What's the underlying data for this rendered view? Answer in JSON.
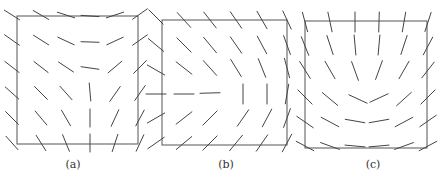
{
  "figure": {
    "panels": [
      {
        "id": "a",
        "caption": "(a)",
        "caption_x": 73,
        "box": {
          "x": 17,
          "y": 16,
          "w": 121,
          "h": 128
        },
        "seg_len": 18,
        "segments": [
          [
            12,
            15,
            32
          ],
          [
            41,
            15,
            30
          ],
          [
            66,
            15,
            18
          ],
          [
            90,
            16,
            4
          ],
          [
            115,
            15,
            -18
          ],
          [
            140,
            14,
            -35
          ],
          [
            12,
            40,
            35
          ],
          [
            41,
            40,
            32
          ],
          [
            66,
            41,
            25
          ],
          [
            90,
            42,
            2
          ],
          [
            115,
            41,
            -25
          ],
          [
            140,
            40,
            -35
          ],
          [
            12,
            67,
            38
          ],
          [
            41,
            67,
            38
          ],
          [
            66,
            67,
            34
          ],
          [
            90,
            68,
            8
          ],
          [
            115,
            67,
            -40
          ],
          [
            140,
            67,
            -45
          ],
          [
            12,
            93,
            42
          ],
          [
            41,
            93,
            45
          ],
          [
            66,
            93,
            48
          ],
          [
            90,
            92,
            85
          ],
          [
            115,
            94,
            -55
          ],
          [
            140,
            93,
            -55
          ],
          [
            12,
            118,
            45
          ],
          [
            41,
            118,
            50
          ],
          [
            66,
            118,
            60
          ],
          [
            90,
            118,
            90
          ],
          [
            115,
            118,
            -65
          ],
          [
            140,
            118,
            -62
          ],
          [
            12,
            143,
            48
          ],
          [
            41,
            143,
            58
          ],
          [
            66,
            143,
            68
          ],
          [
            90,
            143,
            90
          ],
          [
            115,
            143,
            -72
          ],
          [
            140,
            143,
            -65
          ]
        ]
      },
      {
        "id": "b",
        "caption": "(b)",
        "caption_x": 226,
        "box": {
          "x": 162,
          "y": 20,
          "w": 125,
          "h": 125
        },
        "seg_len": 20,
        "segments": [
          [
            156,
            17,
            45
          ],
          [
            184,
            20,
            48
          ],
          [
            210,
            20,
            52
          ],
          [
            236,
            20,
            55
          ],
          [
            262,
            20,
            60
          ],
          [
            287,
            20,
            65
          ],
          [
            156,
            45,
            40
          ],
          [
            184,
            45,
            45
          ],
          [
            210,
            45,
            50
          ],
          [
            236,
            45,
            55
          ],
          [
            262,
            45,
            62
          ],
          [
            287,
            45,
            70
          ],
          [
            156,
            70,
            30
          ],
          [
            184,
            68,
            38
          ],
          [
            210,
            68,
            48
          ],
          [
            236,
            68,
            58
          ],
          [
            262,
            68,
            68
          ],
          [
            287,
            68,
            75
          ],
          [
            156,
            94,
            0
          ],
          [
            184,
            94,
            0
          ],
          [
            210,
            93,
            -2
          ],
          [
            243,
            94,
            90
          ],
          [
            267,
            94,
            90
          ],
          [
            287,
            94,
            -80
          ],
          [
            156,
            118,
            -30
          ],
          [
            184,
            118,
            -38
          ],
          [
            210,
            118,
            -45
          ],
          [
            243,
            118,
            -55
          ],
          [
            267,
            118,
            -62
          ],
          [
            287,
            118,
            -70
          ],
          [
            156,
            143,
            -35
          ],
          [
            184,
            143,
            -40
          ],
          [
            210,
            143,
            -45
          ],
          [
            236,
            143,
            -50
          ],
          [
            262,
            143,
            -55
          ],
          [
            287,
            143,
            -62
          ]
        ]
      },
      {
        "id": "c",
        "caption": "(c)",
        "caption_x": 373,
        "box": {
          "x": 305,
          "y": 21,
          "w": 122,
          "h": 127
        },
        "seg_len": 20,
        "segments": [
          [
            305,
            22,
            75
          ],
          [
            330,
            22,
            78
          ],
          [
            355,
            22,
            90
          ],
          [
            379,
            22,
            -88
          ],
          [
            404,
            22,
            -80
          ],
          [
            428,
            22,
            -72
          ],
          [
            305,
            46,
            68
          ],
          [
            330,
            45,
            72
          ],
          [
            355,
            45,
            85
          ],
          [
            379,
            45,
            -85
          ],
          [
            404,
            45,
            -72
          ],
          [
            428,
            46,
            -62
          ],
          [
            305,
            70,
            58
          ],
          [
            330,
            70,
            60
          ],
          [
            355,
            71,
            70
          ],
          [
            379,
            70,
            -70
          ],
          [
            404,
            70,
            -60
          ],
          [
            428,
            70,
            -52
          ],
          [
            305,
            97,
            45
          ],
          [
            330,
            99,
            40
          ],
          [
            358,
            99,
            25
          ],
          [
            379,
            98,
            -25
          ],
          [
            404,
            99,
            -42
          ],
          [
            428,
            97,
            -45
          ],
          [
            305,
            122,
            35
          ],
          [
            330,
            122,
            28
          ],
          [
            355,
            121,
            10
          ],
          [
            379,
            121,
            -10
          ],
          [
            404,
            122,
            -28
          ],
          [
            428,
            121,
            -35
          ],
          [
            305,
            146,
            28
          ],
          [
            330,
            146,
            20
          ],
          [
            355,
            146,
            5
          ],
          [
            379,
            146,
            -5
          ],
          [
            404,
            146,
            -20
          ],
          [
            428,
            146,
            -28
          ]
        ]
      }
    ]
  }
}
